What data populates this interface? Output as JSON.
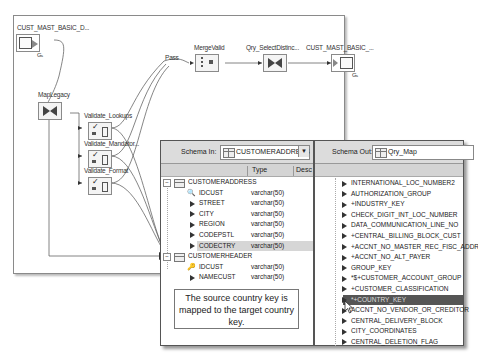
{
  "dataflow": {
    "nodes": [
      {
        "id": "source",
        "label": "CUST_MAST_BASIC_D...",
        "type": "source-table"
      },
      {
        "id": "maplegacy",
        "label": "MapLegacy",
        "type": "query"
      },
      {
        "id": "validate_lookups",
        "label": "Validate_Lookups",
        "type": "validation"
      },
      {
        "id": "validate_mandatory",
        "label": "Validate_Mandator...",
        "type": "validation"
      },
      {
        "id": "validate_format",
        "label": "Validate_Format",
        "type": "validation"
      },
      {
        "id": "pass",
        "label": "Pass",
        "type": "port-label"
      },
      {
        "id": "mergevalid",
        "label": "MergeValid",
        "type": "merge"
      },
      {
        "id": "qry_selectdistinct",
        "label": "Qry_SelectDistinc...",
        "type": "query"
      },
      {
        "id": "target",
        "label": "CUST_MAST_BASIC_...",
        "type": "target-table"
      }
    ]
  },
  "mapping": {
    "schema_in": {
      "label": "Schema In:",
      "value": "CUSTOMERADDRESS",
      "columns": [
        "",
        "Type",
        "Desc"
      ],
      "tables": [
        {
          "name": "CUSTOMERADDRESS",
          "fields": [
            {
              "name": "IDCUST",
              "type": "varchar(50)",
              "key": true
            },
            {
              "name": "STREET",
              "type": "varchar(50)"
            },
            {
              "name": "CITY",
              "type": "varchar(50)"
            },
            {
              "name": "REGION",
              "type": "varchar(50)"
            },
            {
              "name": "CODEPSTL",
              "type": "varchar(50)"
            },
            {
              "name": "CODECTRY",
              "type": "varchar(50)",
              "highlighted": true
            }
          ]
        },
        {
          "name": "CUSTOMERHEADER",
          "fields": [
            {
              "name": "IDCUST",
              "type": "varchar(50)",
              "key": true
            },
            {
              "name": "NAMECUST",
              "type": "varchar(50)"
            }
          ]
        }
      ]
    },
    "schema_out": {
      "label": "Schema Out:",
      "value": "Qry_Map",
      "fields": [
        "INTERNATIONAL_LOC_NUMBER2",
        "AUTHORIZATION_GROUP",
        "+INDUSTRY_KEY",
        "CHECK_DIGIT_INT_LOC_NUMBER",
        "DATA_COMMUNICATION_LINE_NO",
        "+CENTRAL_BILLING_BLOCK_CUST",
        "+ACCNT_NO_MASTER_REC_FISC_ADDR",
        "+ACCNT_NO_ALT_PAYER",
        "GROUP_KEY",
        "*$+CUSTOMER_ACCOUNT_GROUP",
        "+CUSTOMER_CLASSIFICATION",
        "*+COUNTRY_KEY",
        "ACCNT_NO_VENDOR_OR_CREDITOR",
        "CENTRAL_DELIVERY_BLOCK",
        "CITY_COORDINATES",
        "CENTRAL_DELETION_FLAG"
      ],
      "selected_index": 11
    },
    "callout": "The source country key is mapped to the target country key."
  },
  "colors": {
    "selected_row": "#555555",
    "highlight_row": "#d6d6d6",
    "header_bg": "#dcdcdc"
  }
}
